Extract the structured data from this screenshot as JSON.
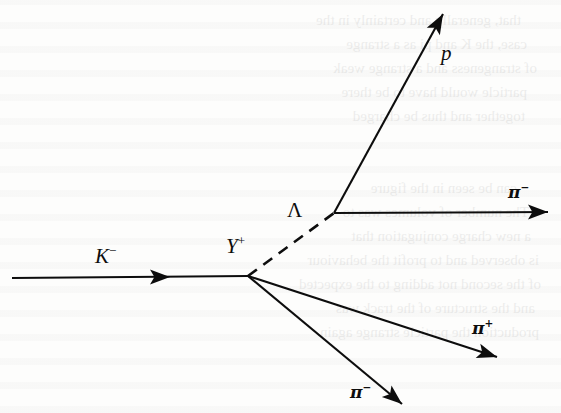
{
  "figure": {
    "type": "bubble-chamber-event-diagram",
    "background_color": "#fdfdfc",
    "ink_color": "#0d0d0d"
  },
  "labels": {
    "beam": {
      "symbol": "K",
      "charge": "−",
      "x": 95,
      "y": 244
    },
    "resonance": {
      "symbol": "Y",
      "charge": "+",
      "x": 226,
      "y": 234
    },
    "lambda": {
      "symbol": "Λ",
      "charge": "",
      "x": 287,
      "y": 200
    },
    "proton": {
      "symbol": "p",
      "charge": "",
      "x": 441,
      "y": 43
    },
    "pion_from_lambda": {
      "symbol": "π",
      "charge": "−",
      "x": 508,
      "y": 182
    },
    "pion_positive": {
      "symbol": "π",
      "charge": "+",
      "x": 472,
      "y": 318
    },
    "pion_negative": {
      "symbol": "π",
      "charge": "−",
      "x": 350,
      "y": 382
    }
  },
  "vertices": {
    "production": {
      "name": "Y-plus production vertex",
      "x": 248,
      "y": 276
    },
    "lambda_decay": {
      "name": "Lambda decay vertex",
      "x": 334,
      "y": 213
    }
  },
  "tracks": [
    {
      "name": "kaon-beam-track",
      "particle": "K−",
      "style": "solid",
      "x1": 12,
      "y1": 278,
      "x2": 248,
      "y2": 276,
      "arrow_at": {
        "x": 170,
        "y": 277
      },
      "arrow_angle": 0
    },
    {
      "name": "lambda-track",
      "particle": "Λ",
      "style": "dashed",
      "x1": 248,
      "y1": 276,
      "x2": 334,
      "y2": 213,
      "arrow_at": null,
      "arrow_angle": null
    },
    {
      "name": "proton-track",
      "particle": "p",
      "style": "solid",
      "x1": 334,
      "y1": 213,
      "x2": 443,
      "y2": 14,
      "arrow_at": {
        "x": 443,
        "y": 14
      },
      "arrow_angle": -61
    },
    {
      "name": "pion-minus-from-lambda-track",
      "particle": "π−",
      "style": "solid",
      "x1": 334,
      "y1": 213,
      "x2": 548,
      "y2": 212,
      "arrow_at": {
        "x": 548,
        "y": 212
      },
      "arrow_angle": 0
    },
    {
      "name": "pion-plus-track",
      "particle": "π+",
      "style": "solid",
      "x1": 248,
      "y1": 276,
      "x2": 497,
      "y2": 357,
      "arrow_at": {
        "x": 497,
        "y": 357
      },
      "arrow_angle": 18
    },
    {
      "name": "pion-minus-track",
      "particle": "π−",
      "style": "solid",
      "x1": 248,
      "y1": 276,
      "x2": 402,
      "y2": 404,
      "arrow_at": {
        "x": 402,
        "y": 404
      },
      "arrow_angle": 40
    }
  ],
  "bleed_through_lines": [
    {
      "text": "that, generally and certainly in the",
      "x": 40,
      "y": 8
    },
    {
      "text": "case, the K and pi as a strange",
      "x": 34,
      "y": 32
    },
    {
      "text": "of strangeness and a strange weak",
      "x": 24,
      "y": 56
    },
    {
      "text": "particle would have to be there",
      "x": 34,
      "y": 80
    },
    {
      "text": "together and thus be charged",
      "x": 36,
      "y": 104
    },
    {
      "text": "can be seen in the figure",
      "x": 44,
      "y": 176
    },
    {
      "text": "The number of volumes was to",
      "x": 32,
      "y": 200
    },
    {
      "text": "a new charge conjugation that",
      "x": 30,
      "y": 224
    },
    {
      "text": "is observed and to profit the behaviour",
      "x": 22,
      "y": 248
    },
    {
      "text": "of the second not adding to the expected",
      "x": 20,
      "y": 272
    },
    {
      "text": "and the structure of the track was",
      "x": 26,
      "y": 296
    },
    {
      "text": "production the particle strange again",
      "x": 22,
      "y": 320
    }
  ]
}
